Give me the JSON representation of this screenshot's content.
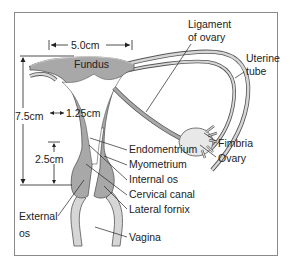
{
  "diagram": {
    "colors": {
      "tissue": "#a8a8a8",
      "light_tissue": "#d6d6d6",
      "outline": "#555555",
      "frame": "#8a8a8a",
      "text": "#222222"
    },
    "dimensions": {
      "width": "5.0cm",
      "length": "7.5cm",
      "wall": "1.25cm",
      "cervix": "2.5cm"
    },
    "labels": {
      "fundus": "Fundus",
      "ligament_line1": "Ligament",
      "ligament_line2": "of ovary",
      "tube_line1": "Uterine",
      "tube_line2": "tube",
      "fimbria": "Fimbria",
      "ovary": "Ovary",
      "endometrium": "Endomentrium",
      "myometrium": "Myometrium",
      "internal_os": "Internal os",
      "cervical_canal": "Cervical canal",
      "lateral_fornix": "Lateral fornix",
      "external_line1": "External",
      "external_line2": "os",
      "vagina": "Vagina"
    }
  }
}
